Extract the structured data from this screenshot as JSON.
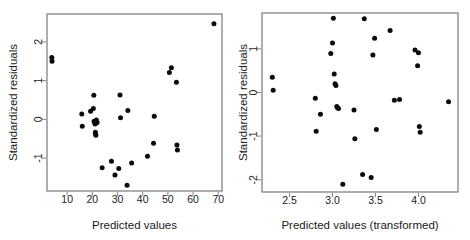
{
  "figure": {
    "background": "#ffffff",
    "point_color": "#0b0b0b",
    "frame_color": "#8c8c8c",
    "panel_count": 2
  },
  "chart_data": [
    {
      "type": "scatter",
      "panel": "left",
      "title": "",
      "xlabel": "Predicted values",
      "ylabel": "Standardized residuals",
      "xticks": [
        10,
        20,
        30,
        40,
        50,
        60,
        70
      ],
      "xticklabels": [
        "10",
        "20",
        "30",
        "40",
        "50",
        "60",
        "70"
      ],
      "yticks": [
        -1,
        0,
        1,
        2
      ],
      "yticklabels": [
        "-1",
        "0",
        "1",
        "2"
      ],
      "xlim": [
        2.0,
        71.5
      ],
      "ylim": [
        -1.85,
        2.72
      ],
      "grid": false,
      "legend": null,
      "x": [
        3.9,
        4.0,
        15.8,
        16.0,
        19.3,
        20.4,
        20.6,
        20.7,
        21.0,
        21.1,
        21.2,
        21.3,
        21.4,
        21.6,
        21.9,
        23.9,
        27.6,
        29.0,
        30.5,
        31.0,
        31.2,
        33.8,
        34.1,
        35.6,
        41.9,
        44.3,
        44.6,
        50.6,
        51.4,
        53.4,
        53.6,
        53.8,
        68.3
      ],
      "y": [
        1.6,
        1.5,
        0.14,
        -0.18,
        0.21,
        0.28,
        0.62,
        -0.05,
        -0.09,
        -0.12,
        -0.33,
        -0.37,
        -0.41,
        -0.02,
        -0.08,
        -1.25,
        -1.08,
        -1.44,
        -1.27,
        0.63,
        0.04,
        -1.7,
        0.23,
        -1.13,
        -0.95,
        -0.62,
        0.08,
        1.21,
        1.33,
        0.96,
        -0.66,
        -0.79,
        2.47
      ]
    },
    {
      "type": "scatter",
      "panel": "right",
      "title": "",
      "xlabel": "Predicted values (transformed)",
      "ylabel": "Standardized residuals",
      "xticks": [
        2.5,
        3.0,
        3.5,
        4.0
      ],
      "xticklabels": [
        "2.5",
        "3.0",
        "3.5",
        "4.0"
      ],
      "yticks": [
        -2,
        -1,
        0,
        1
      ],
      "yticklabels": [
        "-2",
        "-1",
        "0",
        "1"
      ],
      "xlim": [
        2.18,
        4.46
      ],
      "ylim": [
        -2.28,
        1.82
      ],
      "grid": false,
      "legend": null,
      "x": [
        2.3,
        2.31,
        2.8,
        2.81,
        2.86,
        2.98,
        3.0,
        3.01,
        3.02,
        3.03,
        3.04,
        3.05,
        3.06,
        3.07,
        3.12,
        3.25,
        3.26,
        3.35,
        3.37,
        3.45,
        3.47,
        3.49,
        3.51,
        3.67,
        3.72,
        3.78,
        3.96,
        3.99,
        4.0,
        4.01,
        4.02,
        4.35
      ],
      "y": [
        0.35,
        0.05,
        -0.13,
        -0.89,
        -0.5,
        0.89,
        1.13,
        1.7,
        0.42,
        0.2,
        0.16,
        -0.32,
        -0.35,
        -0.37,
        -2.1,
        -0.4,
        -1.06,
        -1.88,
        1.69,
        -1.95,
        0.86,
        1.24,
        -0.85,
        1.42,
        -0.18,
        -0.16,
        0.97,
        0.61,
        0.91,
        -0.78,
        -0.91,
        -0.21
      ]
    }
  ]
}
